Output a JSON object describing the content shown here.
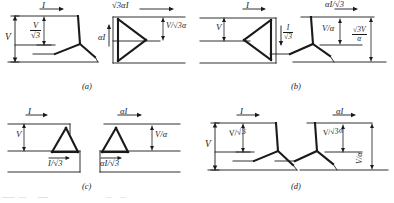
{
  "figure": {
    "type": "transformer-connection-diagrams",
    "background": "#ffffff",
    "ink": "#1a1a1a",
    "panels": [
      {
        "id": "a",
        "caption": "(a)",
        "primary": {
          "connection": "wye",
          "labels": [
            {
              "name": "line-current",
              "text": "I",
              "kind": "current",
              "arrow": "right"
            },
            {
              "name": "line-voltage",
              "text": "V",
              "kind": "voltage",
              "arrow": "updown"
            },
            {
              "name": "phase-voltage",
              "num": "V",
              "den": "√3",
              "kind": "voltage",
              "arrow": "updown"
            }
          ]
        },
        "secondary": {
          "connection": "delta",
          "labels": [
            {
              "name": "line-current",
              "text": "√3αI",
              "kind": "current",
              "arrow": "right"
            },
            {
              "name": "phase-current",
              "text": "αI",
              "kind": "current",
              "arrow": "up"
            },
            {
              "name": "line-voltage",
              "num": "V",
              "den": "√3α",
              "inline": "V/√3α",
              "kind": "voltage",
              "arrow": "updown"
            }
          ]
        }
      },
      {
        "id": "b",
        "caption": "(b)",
        "primary": {
          "connection": "delta",
          "labels": [
            {
              "name": "line-current",
              "text": "I",
              "kind": "current",
              "arrow": "right"
            },
            {
              "name": "line-voltage",
              "text": "V",
              "kind": "voltage",
              "arrow": "updown"
            },
            {
              "name": "phase-current",
              "num": "I",
              "den": "√3",
              "kind": "current",
              "arrow": "down"
            }
          ]
        },
        "secondary": {
          "connection": "wye",
          "labels": [
            {
              "name": "line-current",
              "num": "αI",
              "den": "√3",
              "inline": "αI/√3",
              "kind": "current",
              "arrow": "right"
            },
            {
              "name": "phase-voltage",
              "num": "V",
              "den": "α",
              "inline": "V/α",
              "kind": "voltage",
              "arrow": "updown"
            },
            {
              "name": "line-voltage",
              "num": "√3V",
              "den": "α",
              "kind": "voltage",
              "arrow": "updown"
            }
          ]
        }
      },
      {
        "id": "c",
        "caption": "(c)",
        "primary": {
          "connection": "delta",
          "labels": [
            {
              "name": "line-current",
              "text": "I",
              "kind": "current",
              "arrow": "right"
            },
            {
              "name": "line-voltage",
              "text": "V",
              "kind": "voltage",
              "arrow": "updown"
            },
            {
              "name": "phase-current",
              "text": "I/√3",
              "kind": "current",
              "arrow": "right"
            }
          ]
        },
        "secondary": {
          "connection": "delta",
          "labels": [
            {
              "name": "line-current",
              "text": "αI",
              "kind": "current",
              "arrow": "right"
            },
            {
              "name": "line-voltage",
              "num": "V",
              "den": "α",
              "inline": "V/α",
              "kind": "voltage",
              "arrow": "updown"
            },
            {
              "name": "phase-current",
              "text": "αI/√3",
              "kind": "current",
              "arrow": "right"
            }
          ]
        }
      },
      {
        "id": "d",
        "caption": "(d)",
        "primary": {
          "connection": "wye",
          "labels": [
            {
              "name": "line-current",
              "text": "I",
              "kind": "current",
              "arrow": "right"
            },
            {
              "name": "line-voltage",
              "text": "V",
              "kind": "voltage",
              "arrow": "updown"
            },
            {
              "name": "phase-voltage",
              "num": "V",
              "den": "√3",
              "inline": "V/√3",
              "kind": "voltage",
              "arrow": "updown"
            }
          ]
        },
        "secondary": {
          "connection": "wye",
          "labels": [
            {
              "name": "line-current",
              "text": "αI",
              "kind": "current",
              "arrow": "right"
            },
            {
              "name": "phase-voltage",
              "num": "V",
              "den": "√3α",
              "inline": "V/√3α",
              "kind": "voltage",
              "arrow": "updown"
            },
            {
              "name": "line-voltage",
              "num": "V",
              "den": "α",
              "inline": "V/α",
              "kind": "voltage",
              "arrow": "updown"
            }
          ]
        }
      }
    ]
  },
  "text": {
    "I": "I",
    "V": "V",
    "alphaI": "αI",
    "sqrt3alphaI": "√3αI",
    "num_V": "V",
    "den_sqrt3": "√3",
    "den_sqrt3alpha": "√3α",
    "den_alpha": "α",
    "num_I": "I",
    "num_alphaI": "αI",
    "num_sqrt3V": "√3V",
    "I_over_sqrt3_inline": "I/√3",
    "alphaI_over_sqrt3_inline": "αI/√3",
    "cap_a": "(a)",
    "cap_b": "(b)",
    "cap_c": "(c)",
    "cap_d": "(d)"
  }
}
